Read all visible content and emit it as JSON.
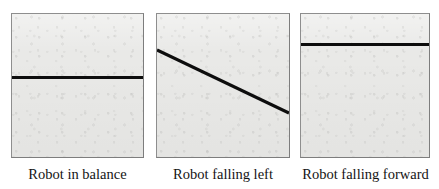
{
  "figure": {
    "panel_count": 3,
    "background_color": "#ffffff",
    "panel_fill_color": "#e9e9e7",
    "panel_border_color": "#8e8e8e",
    "line_color": "#0d0d0d"
  },
  "panels": [
    {
      "id": "robot-in-balance",
      "caption": "Robot in balance",
      "line_type": "horizontal",
      "tilt_degrees": 0,
      "line_position_pct": 43
    },
    {
      "id": "robot-falling-left",
      "caption": "Robot falling left",
      "line_type": "diagonal",
      "tilt_degrees": 25,
      "line_start": {
        "x_pct": 0,
        "y_pct": 25
      },
      "line_end": {
        "x_pct": 100,
        "y_pct": 69
      }
    },
    {
      "id": "robot-falling-forward",
      "caption": "Robot falling forward",
      "line_type": "horizontal",
      "tilt_degrees": 0,
      "line_position_pct": 20
    }
  ]
}
